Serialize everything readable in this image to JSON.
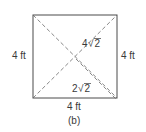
{
  "figure": {
    "caption": "(b)",
    "square": {
      "x": 33,
      "y": 15,
      "width": 84,
      "height": 83,
      "stroke": "#4a4a4a"
    },
    "diagonal_color": "#6a6a6a",
    "labels": {
      "left_side": "4 ft",
      "right_side": "4 ft",
      "bottom_side": "4 ft",
      "full_diagonal_coef": "4",
      "full_diagonal_radicand": "2",
      "half_diagonal_coef": "2",
      "half_diagonal_radicand": "2"
    }
  }
}
